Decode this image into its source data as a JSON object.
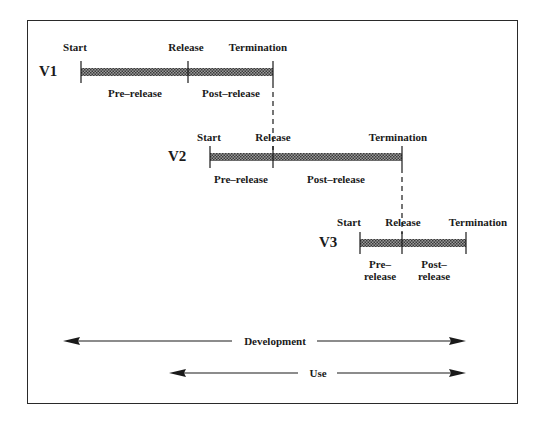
{
  "diagram": {
    "versions": [
      {
        "name": "V1",
        "labels": {
          "start": "Start",
          "release": "Release",
          "termination": "Termination",
          "pre": "Pre–release",
          "post": "Post–release"
        }
      },
      {
        "name": "V2",
        "labels": {
          "start": "Start",
          "release": "Release",
          "termination": "Termination",
          "pre": "Pre–release",
          "post": "Post–release"
        }
      },
      {
        "name": "V3",
        "labels": {
          "start": "Start",
          "release": "Release",
          "termination": "Termination",
          "pre_line1": "Pre–",
          "pre_line2": "release",
          "post_line1": "Post–",
          "post_line2": "release"
        }
      }
    ],
    "arrows": {
      "development": "Development",
      "use": "Use"
    },
    "colors": {
      "line": "#1a1a1a",
      "bar_fill": "#6f6f6f",
      "frame": "#2a2a2a"
    }
  }
}
